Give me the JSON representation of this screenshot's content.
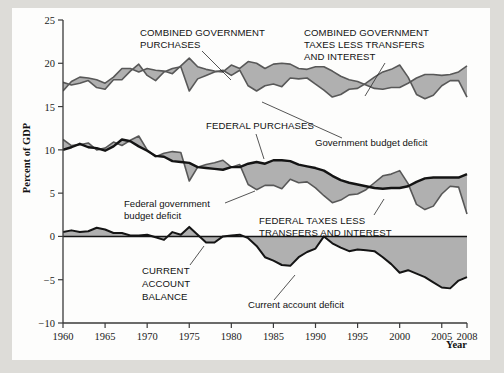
{
  "figure": {
    "background_color": "#dddcd8",
    "paper_color": "#fdfdfc"
  },
  "axes": {
    "y_axis_title": "Percent of GDP",
    "x_axis_title": "Year",
    "y_ticks": [
      "25",
      "20",
      "15",
      "10",
      "5",
      "0",
      "-5",
      "-10"
    ],
    "x_ticks": [
      "1960",
      "1965",
      "1970",
      "1975",
      "1980",
      "1985",
      "1990",
      "1995",
      "2000",
      "2005",
      "2008"
    ]
  },
  "annotations": {
    "combined_purchases": "COMBINED GOVERNMENT\nPURCHASES",
    "combined_purchases_line1": "COMBINED GOVERNMENT",
    "combined_purchases_line2": "PURCHASES",
    "combined_taxes_line1": "COMBINED GOVERNMENT",
    "combined_taxes_line2": "TAXES LESS TRANSFERS",
    "combined_taxes_line3": "AND INTEREST",
    "government_budget_deficit": "Government budget deficit",
    "federal_purchases": "FEDERAL PURCHASES",
    "federal_government_budget_deficit_line1": "Federal government",
    "federal_government_budget_deficit_line2": "budget deficit",
    "federal_taxes_line1": "FEDERAL TAXES LESS",
    "federal_taxes_line2": "TRANSFERS AND INTEREST",
    "current_account_balance_line1": "CURRENT",
    "current_account_balance_line2": "ACCOUNT",
    "current_account_balance_line3": "BALANCE",
    "current_account_deficit": "Current account deficit"
  },
  "colors": {
    "fill_gray": "#b0b0b0",
    "line_dark": "#141414",
    "line_medium": "#585858",
    "axis": "#3a3a3a"
  },
  "chart_data": {
    "type": "line",
    "title": "",
    "xlabel": "Year",
    "ylabel": "Percent of GDP",
    "xlim": [
      1960,
      2008
    ],
    "ylim": [
      -10,
      25
    ],
    "grid": false,
    "legend": "inline annotations",
    "x": [
      1960,
      1961,
      1962,
      1963,
      1964,
      1965,
      1966,
      1967,
      1968,
      1969,
      1970,
      1971,
      1972,
      1973,
      1974,
      1975,
      1976,
      1977,
      1978,
      1979,
      1980,
      1981,
      1982,
      1983,
      1984,
      1985,
      1986,
      1987,
      1988,
      1989,
      1990,
      1991,
      1992,
      1993,
      1994,
      1995,
      1996,
      1997,
      1998,
      1999,
      2000,
      2001,
      2002,
      2003,
      2004,
      2005,
      2006,
      2007,
      2008
    ],
    "series": [
      {
        "name": "COMBINED GOVERNMENT PURCHASES",
        "values": [
          16.8,
          17.9,
          18.4,
          18.3,
          18.1,
          17.7,
          18.4,
          19.4,
          19.4,
          19.0,
          19.4,
          19.2,
          19.1,
          18.8,
          19.7,
          20.6,
          19.6,
          19.3,
          19.1,
          19.0,
          19.8,
          19.4,
          20.2,
          20.0,
          19.4,
          19.9,
          20.0,
          19.9,
          19.4,
          19.3,
          19.6,
          19.6,
          19.1,
          18.5,
          18.1,
          17.9,
          17.5,
          17.1,
          17.0,
          17.2,
          17.2,
          17.7,
          18.3,
          18.7,
          18.7,
          18.6,
          18.7,
          19.0,
          19.7
        ]
      },
      {
        "name": "COMBINED GOVERNMENT TAXES LESS TRANSFERS AND INTEREST",
        "values": [
          17.8,
          17.5,
          17.7,
          18.0,
          17.2,
          17.0,
          18.1,
          18.1,
          19.1,
          19.9,
          18.6,
          18.0,
          19.0,
          19.4,
          19.6,
          16.8,
          18.2,
          18.6,
          19.0,
          19.2,
          18.6,
          19.2,
          17.4,
          16.8,
          17.4,
          17.6,
          17.3,
          18.3,
          18.2,
          18.3,
          17.6,
          16.9,
          16.1,
          16.4,
          17.0,
          17.1,
          17.7,
          18.4,
          19.0,
          19.3,
          19.8,
          18.4,
          16.4,
          15.9,
          16.3,
          17.4,
          18.0,
          18.0,
          16.1
        ]
      },
      {
        "name": "FEDERAL PURCHASES",
        "values": [
          10.0,
          10.3,
          10.7,
          10.3,
          10.2,
          9.9,
          10.4,
          11.2,
          11.0,
          10.4,
          9.9,
          9.3,
          9.2,
          8.7,
          8.6,
          8.5,
          8.0,
          7.9,
          7.8,
          7.7,
          8.0,
          8.0,
          8.4,
          8.6,
          8.4,
          8.8,
          8.8,
          8.7,
          8.3,
          8.1,
          7.9,
          7.6,
          7.0,
          6.5,
          6.2,
          6.0,
          5.8,
          5.6,
          5.5,
          5.6,
          5.6,
          5.8,
          6.3,
          6.7,
          6.8,
          6.8,
          6.8,
          6.8,
          7.2
        ]
      },
      {
        "name": "FEDERAL TAXES LESS TRANSFERS AND INTEREST",
        "values": [
          11.2,
          10.5,
          10.6,
          10.8,
          10.0,
          10.2,
          10.9,
          10.5,
          11.1,
          11.6,
          10.0,
          9.2,
          9.6,
          9.8,
          9.7,
          6.4,
          8.0,
          8.3,
          8.5,
          8.8,
          8.0,
          8.3,
          6.0,
          5.4,
          5.9,
          5.9,
          5.5,
          6.6,
          6.2,
          6.3,
          5.6,
          4.7,
          3.9,
          4.2,
          4.8,
          4.9,
          5.4,
          6.2,
          7.0,
          7.2,
          7.6,
          6.1,
          3.7,
          3.1,
          3.5,
          4.9,
          5.8,
          5.7,
          2.6
        ]
      },
      {
        "name": "CURRENT ACCOUNT BALANCE",
        "values": [
          0.5,
          0.7,
          0.5,
          0.6,
          1.0,
          0.8,
          0.4,
          0.4,
          0.1,
          0.1,
          0.2,
          -0.1,
          -0.4,
          0.5,
          0.2,
          1.1,
          0.2,
          -0.7,
          -0.7,
          0.0,
          0.1,
          0.2,
          -0.2,
          -1.1,
          -2.4,
          -2.8,
          -3.3,
          -3.4,
          -2.4,
          -1.8,
          -1.4,
          0.0,
          -0.8,
          -1.3,
          -1.7,
          -1.5,
          -1.6,
          -1.7,
          -2.4,
          -3.2,
          -4.2,
          -3.9,
          -4.3,
          -4.7,
          -5.3,
          -5.9,
          -6.0,
          -5.1,
          -4.7
        ]
      }
    ]
  }
}
